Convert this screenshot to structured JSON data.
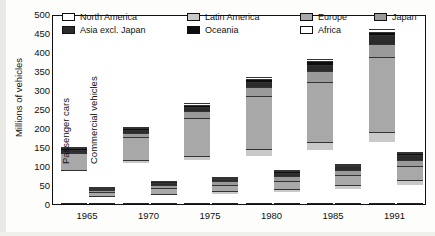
{
  "chart_data": {
    "type": "bar",
    "title": "",
    "xlabel": "",
    "ylabel": "Millions of vehicles",
    "ylim": [
      0,
      500
    ],
    "yticks": [
      0,
      50,
      100,
      150,
      200,
      250,
      300,
      350,
      400,
      450,
      500
    ],
    "grid": false,
    "legend_position": "top-inside",
    "stacked": true,
    "categories": [
      "1965",
      "1970",
      "1975",
      "1980",
      "1985",
      "1991"
    ],
    "group_labels": [
      "Passenger cars",
      "Commercial vehicles"
    ],
    "legend": [
      {
        "name": "North America",
        "color": "#ffffff"
      },
      {
        "name": "Latin America",
        "color": "#c9c9c9"
      },
      {
        "name": "Europe",
        "color": "#a8a8a8"
      },
      {
        "name": "Japan",
        "color": "#9a9a9a"
      },
      {
        "name": "Asia excl. Japan",
        "color": "#2b2b2b"
      },
      {
        "name": "Oceania",
        "color": "#0d0d0d"
      },
      {
        "name": "Africa",
        "color": "#ffffff"
      }
    ],
    "series": [
      {
        "name": "North America",
        "color": "#ffffff",
        "passenger": [
          83,
          105,
          113,
          125,
          139,
          160
        ],
        "commercial": [
          16,
          20,
          24,
          28,
          36,
          47
        ]
      },
      {
        "name": "Latin America",
        "color": "#c9c9c9",
        "passenger": [
          4,
          8,
          12,
          17,
          21,
          27
        ],
        "commercial": [
          3,
          5,
          7,
          9,
          11,
          14
        ]
      },
      {
        "name": "Europe",
        "color": "#a8a8a8",
        "passenger": [
          44,
          60,
          99,
          139,
          158,
          196
        ],
        "commercial": [
          10,
          14,
          16,
          22,
          27,
          36
        ]
      },
      {
        "name": "Japan",
        "color": "#9a9a9a",
        "passenger": [
          2,
          10,
          17,
          24,
          29,
          36
        ],
        "commercial": [
          5,
          9,
          10,
          12,
          13,
          16
        ]
      },
      {
        "name": "Asia excl. Japan",
        "color": "#2b2b2b",
        "passenger": [
          7,
          9,
          11,
          14,
          17,
          22
        ],
        "commercial": [
          4,
          6,
          7,
          9,
          11,
          14
        ]
      },
      {
        "name": "Oceania",
        "color": "#0d0d0d",
        "passenger": [
          5,
          6,
          7,
          8,
          9,
          10
        ],
        "commercial": [
          1,
          2,
          2,
          3,
          3,
          4
        ]
      },
      {
        "name": "Africa",
        "color": "#ffffff",
        "passenger": [
          3,
          3,
          4,
          5,
          6,
          7
        ],
        "commercial": [
          1,
          2,
          2,
          3,
          3,
          4
        ]
      }
    ],
    "totals": {
      "passenger": [
        148,
        201,
        263,
        332,
        379,
        458
      ],
      "commercial": [
        40,
        58,
        68,
        86,
        104,
        135
      ]
    }
  },
  "axis": {
    "y_title": "Millions of vehicles",
    "y_labels": [
      "500",
      "450",
      "400",
      "350",
      "300",
      "250",
      "200",
      "150",
      "100",
      "50",
      "0"
    ],
    "x_labels": [
      "1965",
      "1970",
      "1975",
      "1980",
      "1985",
      "1991"
    ]
  },
  "annotations": {
    "passenger_cars": "Passenger cars",
    "commercial_vehicles": "Commercial vehicles"
  },
  "legend": {
    "north_america": "North America",
    "latin_america": "Latin America",
    "europe": "Europe",
    "japan": "Japan",
    "asia_excl_japan": "Asia excl. Japan",
    "oceania": "Oceania",
    "africa": "Africa"
  }
}
